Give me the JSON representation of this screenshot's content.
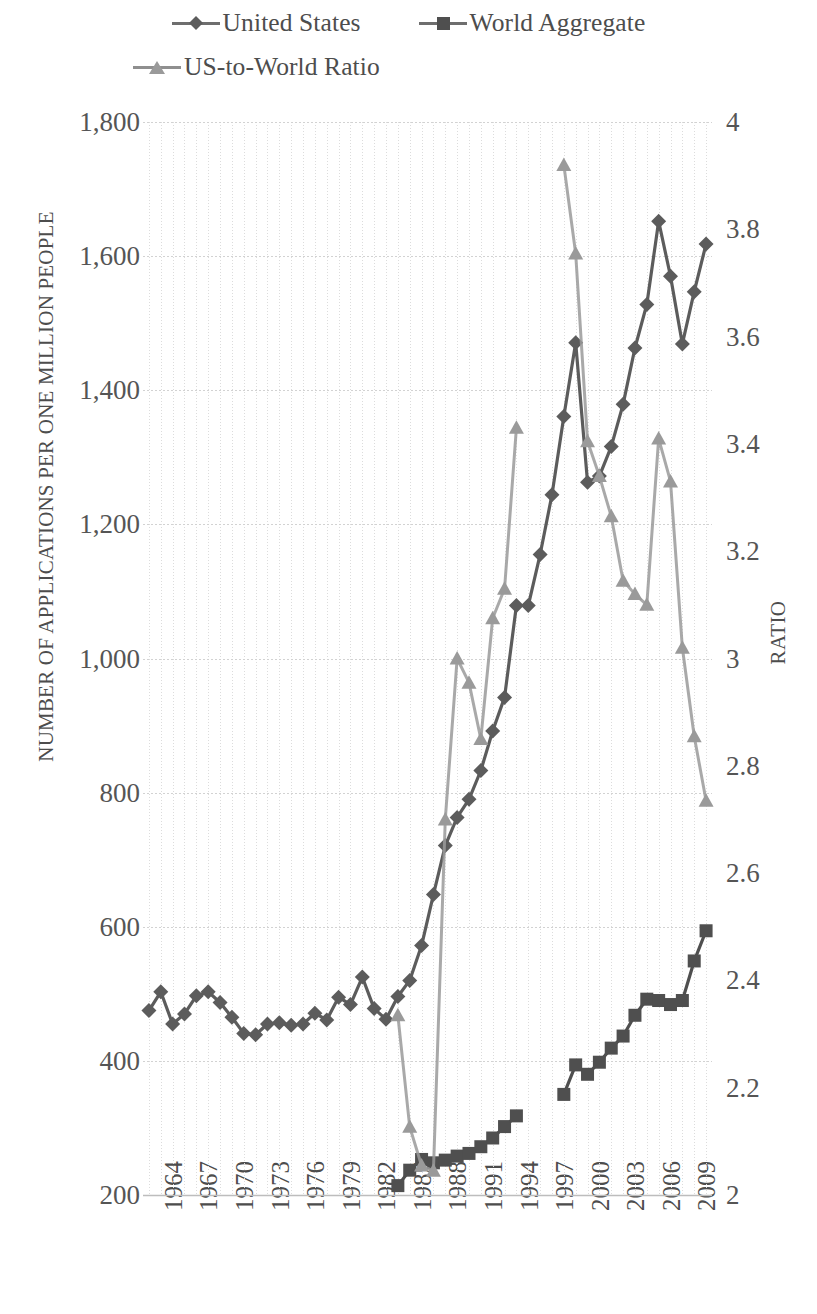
{
  "legend": {
    "items": [
      {
        "label": "United States",
        "marker": "diamond",
        "color": "#5c5c5c"
      },
      {
        "label": "World Aggregate",
        "marker": "square",
        "color": "#4f4f4f"
      },
      {
        "label": "US-to-World Ratio",
        "marker": "triangle",
        "color": "#9a9a9a"
      }
    ]
  },
  "axes": {
    "y_left_title": "NUMBER OF APPLICATIONS PER ONE MILLION PEOPLE",
    "y_right_title": "RATIO",
    "y_left_ticks": [
      "1,800",
      "1,600",
      "1,400",
      "1,200",
      "1,000",
      "800",
      "600",
      "400",
      "200"
    ],
    "y_right_ticks": [
      "4",
      "3.8",
      "3.6",
      "3.4",
      "3.2",
      "3",
      "2.8",
      "2.6",
      "2.4",
      "2.2",
      "2"
    ],
    "x_ticks": [
      "1964",
      "1967",
      "1970",
      "1973",
      "1976",
      "1979",
      "1982",
      "1985",
      "1988",
      "1991",
      "1994",
      "1997",
      "2000",
      "2003",
      "2006",
      "2009"
    ]
  },
  "chart_data": {
    "type": "line",
    "title": "",
    "xlabel": "",
    "ylabel": "NUMBER OF APPLICATIONS PER ONE MILLION PEOPLE",
    "y2label": "RATIO",
    "ylim": [
      200,
      1800
    ],
    "y2lim": [
      2,
      4
    ],
    "xlim": [
      1964,
      2011
    ],
    "grid": true,
    "legend_position": "top",
    "x": [
      1964,
      1965,
      1966,
      1967,
      1968,
      1969,
      1970,
      1971,
      1972,
      1973,
      1974,
      1975,
      1976,
      1977,
      1978,
      1979,
      1980,
      1981,
      1982,
      1983,
      1984,
      1985,
      1986,
      1987,
      1988,
      1989,
      1990,
      1991,
      1992,
      1993,
      1994,
      1995,
      1996,
      1997,
      1998,
      1999,
      2000,
      2001,
      2002,
      2003,
      2004,
      2005,
      2006,
      2007,
      2008,
      2009,
      2010,
      2011
    ],
    "series": [
      {
        "name": "United States",
        "marker": "diamond",
        "color": "#5c5c5c",
        "axis": "left",
        "values": [
          475,
          503,
          455,
          470,
          497,
          503,
          487,
          465,
          441,
          439,
          455,
          457,
          453,
          455,
          471,
          461,
          495,
          484,
          525,
          478,
          462,
          496,
          520,
          572,
          648,
          721,
          763,
          790,
          833,
          892,
          942,
          1079,
          1079,
          1155,
          1244,
          1361,
          1471,
          1263,
          1272,
          1316,
          1379,
          1463,
          1528,
          1652,
          1570,
          1469,
          1547,
          1618
        ]
      },
      {
        "name": "World Aggregate",
        "marker": "square",
        "color": "#4f4f4f",
        "axis": "left",
        "values": [
          null,
          null,
          null,
          null,
          null,
          null,
          null,
          null,
          null,
          null,
          null,
          null,
          null,
          null,
          null,
          null,
          null,
          null,
          null,
          null,
          null,
          214,
          237,
          253,
          248,
          252,
          258,
          262,
          272,
          285,
          302,
          318,
          null,
          null,
          null,
          350,
          394,
          380,
          398,
          419,
          437,
          468,
          492,
          490,
          484,
          490,
          549,
          594
        ]
      },
      {
        "name": "US-to-World Ratio",
        "marker": "triangle",
        "color": "#9a9a9a",
        "axis": "right",
        "values": [
          null,
          null,
          null,
          null,
          null,
          null,
          null,
          null,
          null,
          null,
          null,
          null,
          null,
          null,
          null,
          null,
          null,
          null,
          null,
          null,
          null,
          2.335,
          2.127,
          2.055,
          2.045,
          2.7,
          3.0,
          2.955,
          2.85,
          3.075,
          3.13,
          3.43,
          null,
          null,
          null,
          3.92,
          3.755,
          3.405,
          3.34,
          3.265,
          3.145,
          3.12,
          3.1,
          3.41,
          3.33,
          3.02,
          2.855,
          2.735
        ]
      }
    ]
  }
}
